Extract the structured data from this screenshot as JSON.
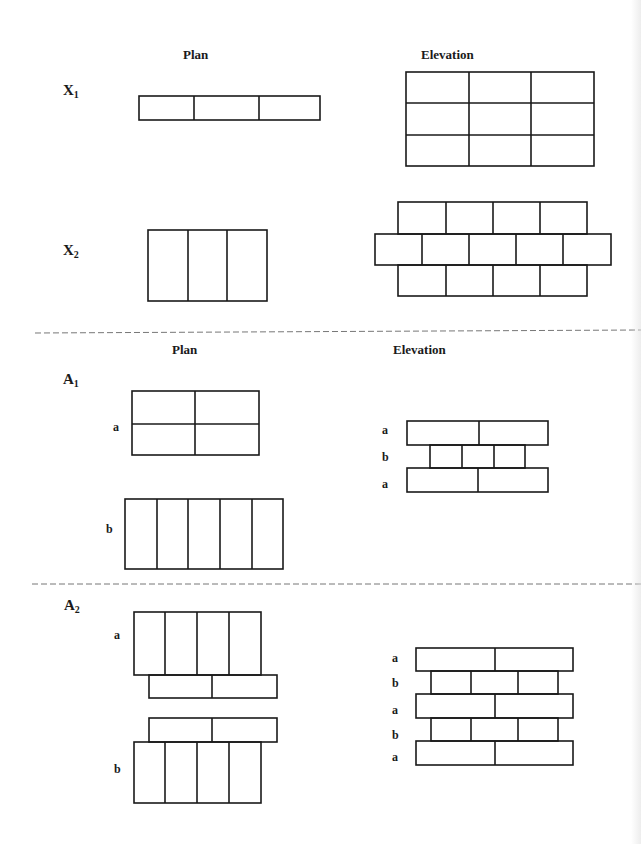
{
  "columns": {
    "plan": "Plan",
    "elevation": "Elevation"
  },
  "sections": [
    {
      "id": "X1",
      "label_main": "X",
      "label_sub": "1",
      "plan": {
        "description": "single row of 3 headers, long side horizontal",
        "bricks": 3
      },
      "elevation": {
        "description": "stack bond grid",
        "rows": 3,
        "cols": 3
      }
    },
    {
      "id": "X2",
      "label_main": "X",
      "label_sub": "2",
      "plan": {
        "description": "3 stretchers side by side, vertical",
        "bricks": 3
      },
      "elevation": {
        "description": "running bond, 4/5/4 courses",
        "courses": [
          4,
          5,
          4
        ]
      }
    },
    {
      "id": "A1",
      "label_main": "A",
      "label_sub": "1",
      "plan": {
        "rows": [
          {
            "label": "a",
            "description": "2x2 grid of stretchers"
          },
          {
            "label": "b",
            "description": "5 headers side by side"
          }
        ]
      },
      "elevation": {
        "courses": [
          {
            "label": "a",
            "bricks": 2
          },
          {
            "label": "b",
            "bricks": 4
          },
          {
            "label": "a",
            "bricks": 2
          }
        ]
      }
    },
    {
      "id": "A2",
      "label_main": "A",
      "label_sub": "2",
      "plan": {
        "rows": [
          {
            "label": "a",
            "description": "4 headers above 2 offset stretchers"
          },
          {
            "label": "b",
            "description": "2 offset stretchers above 4 headers"
          }
        ]
      },
      "elevation": {
        "courses": [
          {
            "label": "a",
            "bricks": 2
          },
          {
            "label": "b",
            "bricks": 3
          },
          {
            "label": "a",
            "bricks": 2
          },
          {
            "label": "b",
            "bricks": 3
          },
          {
            "label": "a",
            "bricks": 2
          }
        ]
      }
    }
  ],
  "colors": {
    "line": "#1a1a1a",
    "divider": "#777777",
    "background": "#ffffff"
  }
}
